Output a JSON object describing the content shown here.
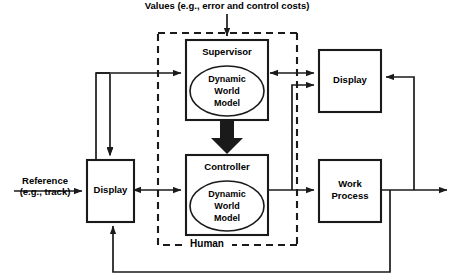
{
  "diagram": {
    "top_label": "Values (e.g., error and control costs)",
    "input_label_line1": "Reference",
    "input_label_line2": "(e.g., track)",
    "boundary_label": "Human",
    "colors": {
      "stroke": "#1a1a1a",
      "background": "#ffffff",
      "text": "#000000"
    },
    "blocks": [
      {
        "id": "supervisor",
        "label": "Supervisor",
        "inner_label_lines": [
          "Dynamic",
          "World",
          "Model"
        ],
        "has_ellipse": true
      },
      {
        "id": "controller",
        "label": "Controller",
        "inner_label_lines": [
          "Dynamic",
          "World",
          "Model"
        ],
        "has_ellipse": true
      },
      {
        "id": "display-left",
        "label": "Display",
        "has_ellipse": false
      },
      {
        "id": "display-right",
        "label": "Display",
        "has_ellipse": false
      },
      {
        "id": "work-process",
        "label_lines": [
          "Work",
          "Process"
        ],
        "label": "Work Process",
        "has_ellipse": false
      }
    ]
  }
}
